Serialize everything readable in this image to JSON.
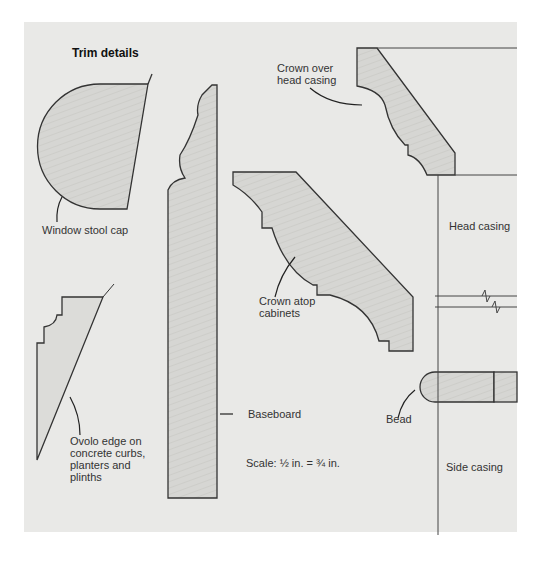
{
  "title": "Trim details",
  "labels": {
    "window_stool_cap": "Window stool cap",
    "ovolo": "Ovolo edge on\nconcrete curbs,\nplanters and\nplinths",
    "baseboard": "Baseboard",
    "crown_over": "Crown over\nhead casing",
    "crown_atop": "Crown atop\ncabinets",
    "head_casing": "Head casing",
    "bead": "Bead",
    "side_casing": "Side casing",
    "scale": "Scale: ½ in. = ¾ in."
  },
  "colors": {
    "background": "#e9e9e7",
    "wood_fill": "#d6d6d3",
    "stroke": "#333333"
  }
}
